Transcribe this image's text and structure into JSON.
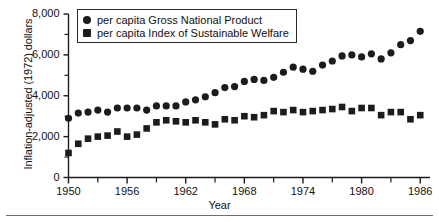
{
  "chart_data": {
    "type": "scatter",
    "title": "",
    "xlabel": "Year",
    "ylabel": "Inflation-adjusted (1972) dollars",
    "xlim": [
      1950,
      1987
    ],
    "ylim": [
      0,
      8000
    ],
    "grid": false,
    "legend_position": "top-left-inside",
    "y_ticks_major": [
      0,
      2000,
      4000,
      6000,
      8000
    ],
    "y_tick_labels": [
      "0",
      "2,000",
      "4,000",
      "6,000",
      "8,000"
    ],
    "y_ticks_minor": [
      1000,
      3000,
      5000,
      7000
    ],
    "x_ticks_major": [
      1950,
      1956,
      1962,
      1968,
      1974,
      1980,
      1986
    ],
    "x_tick_labels": [
      "1950",
      "1956",
      "1962",
      "1968",
      "1974",
      "1980",
      "1986"
    ],
    "x_ticks_minor": [
      1953,
      1959,
      1965,
      1971,
      1977,
      1983
    ],
    "x": [
      1950,
      1951,
      1952,
      1953,
      1954,
      1955,
      1956,
      1957,
      1958,
      1959,
      1960,
      1961,
      1962,
      1963,
      1964,
      1965,
      1966,
      1967,
      1968,
      1969,
      1970,
      1971,
      1972,
      1973,
      1974,
      1975,
      1976,
      1977,
      1978,
      1979,
      1980,
      1981,
      1982,
      1983,
      1984,
      1985,
      1986
    ],
    "series": [
      {
        "name": "per capita Gross National Product",
        "marker": "circle",
        "color": "#1c1c1c",
        "values": [
          2900,
          3150,
          3200,
          3300,
          3200,
          3400,
          3400,
          3400,
          3300,
          3500,
          3500,
          3500,
          3700,
          3800,
          3950,
          4150,
          4400,
          4450,
          4700,
          4800,
          4750,
          4900,
          5150,
          5400,
          5300,
          5200,
          5500,
          5700,
          5950,
          6000,
          5900,
          6050,
          5800,
          6100,
          6500,
          6700,
          7150
        ]
      },
      {
        "name": "per capita Index of Sustainable Welfare",
        "marker": "square",
        "color": "#1c1c1c",
        "values": [
          1200,
          1650,
          1900,
          2000,
          2050,
          2250,
          2000,
          2100,
          2400,
          2700,
          2800,
          2750,
          2700,
          2800,
          2700,
          2600,
          2850,
          2800,
          3000,
          2950,
          3050,
          3250,
          3200,
          3300,
          3200,
          3250,
          3300,
          3350,
          3450,
          3250,
          3400,
          3400,
          3050,
          3200,
          3200,
          2850,
          3050
        ]
      }
    ]
  },
  "legend": {
    "items": [
      {
        "label": "per capita Gross National Product",
        "marker": "circle"
      },
      {
        "label": "per capita Index of Sustainable Welfare",
        "marker": "square"
      }
    ]
  },
  "axes": {
    "ylabel": "Inflation-adjusted (1972) dollars",
    "xlabel": "Year"
  }
}
